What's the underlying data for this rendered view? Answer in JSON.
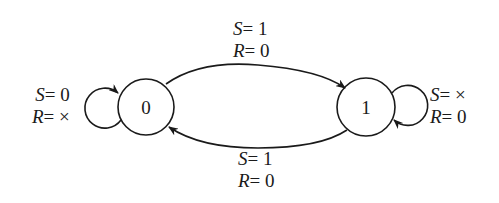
{
  "diagram": {
    "type": "state-diagram",
    "states": [
      {
        "id": "s0",
        "label": "0"
      },
      {
        "id": "s1",
        "label": "1"
      }
    ],
    "transitions": [
      {
        "from": "0",
        "to": "0",
        "line1_var": "S",
        "line1_val": "= 0",
        "line2_var": "R",
        "line2_val": "= ×"
      },
      {
        "from": "0",
        "to": "1",
        "line1_var": "S",
        "line1_val": "= 1",
        "line2_var": "R",
        "line2_val": "= 0"
      },
      {
        "from": "1",
        "to": "0",
        "line1_var": "S",
        "line1_val": "= 1",
        "line2_var": "R",
        "line2_val": "= 0"
      },
      {
        "from": "1",
        "to": "1",
        "line1_var": "S",
        "line1_val": "= ×",
        "line2_var": "R",
        "line2_val": "= 0"
      }
    ]
  }
}
